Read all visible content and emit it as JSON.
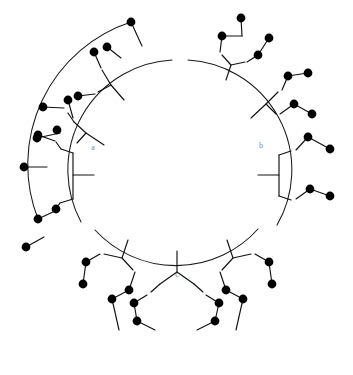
{
  "figure": {
    "type": "circular-dendrogram",
    "title": "",
    "background_color": "#ffffff",
    "line_color": "#111111",
    "tip_color": "#000000",
    "label_color": "#8a8a8a",
    "width": 353,
    "height": 375,
    "center": {
      "x": 176,
      "y": 175
    },
    "inner_radius": 72,
    "arc_radius": 96
  },
  "clusters": [
    {
      "id": "a",
      "label": "a",
      "label_position": {
        "x": 93,
        "y": 148
      },
      "arc": {
        "start_angle_deg": 153,
        "end_angle_deg": 293
      },
      "tip_count": 10,
      "description": "left cluster"
    },
    {
      "id": "b",
      "label": "b",
      "label_position": {
        "x": 261,
        "y": 146
      },
      "arc": {
        "start_angle_deg": 20,
        "end_angle_deg": 148
      },
      "tip_count": 11,
      "description": "right cluster"
    },
    {
      "id": "c",
      "label": "c",
      "label_position": {
        "x": 177,
        "y": 275
      },
      "arc": {
        "start_angle_deg": 300,
        "end_angle_deg": 14
      },
      "tip_count": 16,
      "description": "bottom cluster"
    }
  ],
  "chart_data": {
    "type": "tree",
    "title": "",
    "xlabel": "",
    "ylabel": "",
    "legend": [],
    "clusters": [
      "a",
      "b",
      "c"
    ],
    "tips_per_cluster": {
      "a": 10,
      "b": 11,
      "c": 16
    },
    "total_tips": 37
  },
  "geometry": {
    "arcs": [
      {
        "name": "arc-a-outer",
        "d": "M 131 22 A 150 150 0 0 0 38 219"
      },
      {
        "name": "arc-a-inner",
        "d": "M 172 60 A 110 110 0 0 0 81 222"
      },
      {
        "name": "arc-b-inner",
        "d": "M 188 60 A 110 110 0 0 1 277 225"
      },
      {
        "name": "arc-c-inner",
        "d": "M 95 230 A 110 110 0 0 0 258 229"
      }
    ],
    "branches": [
      {
        "name": "a-trunk",
        "d": "M 94 175 L 73 175"
      },
      {
        "name": "a-split",
        "d": "M 73 175 L 73 153 M 73 175 L 73 199"
      },
      {
        "name": "a-u1",
        "d": "M 73 153 L 61 149"
      },
      {
        "name": "a-u1b",
        "d": "M 61 149 L 56 142"
      },
      {
        "name": "a-l1",
        "d": "M 73 199 L 60 203"
      },
      {
        "name": "a-l1b",
        "d": "M 60 203 L 55 210"
      },
      {
        "name": "a-tip1-stem",
        "d": "M 55 141 L 38 135"
      },
      {
        "name": "a-tip2-stem",
        "d": "M 47 167 L 24 167"
      },
      {
        "name": "a-tip3-stem",
        "d": "M 55 211 L 38 219"
      },
      {
        "name": "a-tip4-stem",
        "d": "M 44 237 L 26 247"
      },
      {
        "name": "a-b2-trunk",
        "d": "M 104 145 L 86 133"
      },
      {
        "name": "a-b2-split",
        "d": "M 86 133 L 74 122 M 86 133 L 77 143"
      },
      {
        "name": "a-b2-u",
        "d": "M 74 122 L 68 113"
      },
      {
        "name": "a-b2-tipA",
        "d": "M 64 108 L 43 107"
      },
      {
        "name": "a-b2-tipB",
        "d": "M 60 133 L 37 138"
      },
      {
        "name": "a-b2-tipC",
        "d": "M 73 118 L 68 100"
      },
      {
        "name": "a-b3-trunk",
        "d": "M 124 100 L 111 85"
      },
      {
        "name": "a-b3-split",
        "d": "M 111 85 L 102 70 M 111 85 L 98 92"
      },
      {
        "name": "a-b3-tipD",
        "d": "M 95 94 L 78 96"
      },
      {
        "name": "a-b3-tipE",
        "d": "M 101 68 L 94 52"
      },
      {
        "name": "a-b3-tipF",
        "d": "M 121 58 L 107 47"
      },
      {
        "name": "a-b3-tipG",
        "d": "M 142 46 L 131 22"
      },
      {
        "name": "b-trunk",
        "d": "M 258 175 L 279 175"
      },
      {
        "name": "b-split",
        "d": "M 279 175 L 279 155 M 279 175 L 279 196"
      },
      {
        "name": "b-u1",
        "d": "M 279 155 L 291 151"
      },
      {
        "name": "b-l1",
        "d": "M 279 196 L 291 200"
      },
      {
        "name": "b-u-tipA",
        "d": "M 296 150 L 308 137"
      },
      {
        "name": "b-u-tipB",
        "d": "M 308 137 L 330 149"
      },
      {
        "name": "b-l-tipA",
        "d": "M 296 199 L 310 189"
      },
      {
        "name": "b-l-tipB",
        "d": "M 310 189 L 330 196"
      },
      {
        "name": "b-b2-trunk",
        "d": "M 251 118 L 266 104"
      },
      {
        "name": "b-b2-split",
        "d": "M 266 104 L 278 92 M 266 104 L 276 114"
      },
      {
        "name": "b-b2-tipA",
        "d": "M 280 114 L 294 104"
      },
      {
        "name": "b-b2-tipB",
        "d": "M 294 104 L 312 114"
      },
      {
        "name": "b-b2-tipC",
        "d": "M 282 90 L 288 76"
      },
      {
        "name": "b-b2-tipD",
        "d": "M 288 76 L 308 73"
      },
      {
        "name": "b-b3-trunk",
        "d": "M 226 80 L 231 65"
      },
      {
        "name": "b-b3-split",
        "d": "M 231 65 L 222 55 M 231 65 L 245 62"
      },
      {
        "name": "b-b3-tipA",
        "d": "M 247 62 L 258 55"
      },
      {
        "name": "b-b3-tipB",
        "d": "M 258 55 L 269 38"
      },
      {
        "name": "b-b3-tipC",
        "d": "M 220 52 L 222 36"
      },
      {
        "name": "b-b3-tipD",
        "d": "M 222 36 L 242 36"
      },
      {
        "name": "b-b3-tipE",
        "d": "M 242 36 L 241 18"
      },
      {
        "name": "c-trunk",
        "d": "M 177 251 L 177 272"
      },
      {
        "name": "c-split",
        "d": "M 177 272 L 160 284 M 177 272 L 194 284"
      },
      {
        "name": "c-l-u",
        "d": "M 160 284 L 151 292"
      },
      {
        "name": "c-r-u",
        "d": "M 194 284 L 203 292"
      },
      {
        "name": "c-l-tipA",
        "d": "M 147 295 L 134 303"
      },
      {
        "name": "c-l-tipB",
        "d": "M 134 303 L 137 321"
      },
      {
        "name": "c-l-tipC",
        "d": "M 137 321 L 155 330"
      },
      {
        "name": "c-r-tipA",
        "d": "M 206 295 L 219 303"
      },
      {
        "name": "c-r-tipB",
        "d": "M 219 303 L 215 321"
      },
      {
        "name": "c-r-tipC",
        "d": "M 215 321 L 197 330"
      },
      {
        "name": "c-bl-trunk",
        "d": "M 128 240 L 122 258"
      },
      {
        "name": "c-bl-split",
        "d": "M 122 258 L 104 254 M 122 258 L 133 270"
      },
      {
        "name": "c-bl-tipA",
        "d": "M 100 254 L 86 262"
      },
      {
        "name": "c-bl-tipB",
        "d": "M 86 262 L 83 284"
      },
      {
        "name": "c-bl-tipC",
        "d": "M 135 272 L 129 290"
      },
      {
        "name": "c-bl-tipD",
        "d": "M 129 290 L 112 299"
      },
      {
        "name": "c-bl-tipE",
        "d": "M 112 299 L 119 330"
      },
      {
        "name": "c-br-trunk",
        "d": "M 227 240 L 233 258"
      },
      {
        "name": "c-br-split",
        "d": "M 233 258 L 251 254 M 233 258 L 222 270"
      },
      {
        "name": "c-br-tipA",
        "d": "M 255 254 L 269 262"
      },
      {
        "name": "c-br-tipB",
        "d": "M 269 262 L 272 284"
      },
      {
        "name": "c-br-tipC",
        "d": "M 220 272 L 226 290"
      },
      {
        "name": "c-br-tipD",
        "d": "M 226 290 L 243 299"
      },
      {
        "name": "c-br-tipE",
        "d": "M 243 299 L 236 330"
      }
    ],
    "tips": [
      {
        "name": "tip-a-01",
        "cx": 38,
        "cy": 135,
        "r": 4.4
      },
      {
        "name": "tip-a-02",
        "cx": 24,
        "cy": 167,
        "r": 4.4
      },
      {
        "name": "tip-a-03",
        "cx": 38,
        "cy": 219,
        "r": 4.4
      },
      {
        "name": "tip-a-04",
        "cx": 26,
        "cy": 247,
        "r": 4.4
      },
      {
        "name": "tip-a-05",
        "cx": 43,
        "cy": 107,
        "r": 4.4
      },
      {
        "name": "tip-a-06",
        "cx": 37,
        "cy": 138,
        "r": 4.4
      },
      {
        "name": "tip-a-07",
        "cx": 68,
        "cy": 100,
        "r": 4.4
      },
      {
        "name": "tip-a-08",
        "cx": 78,
        "cy": 96,
        "r": 4.4
      },
      {
        "name": "tip-a-09",
        "cx": 94,
        "cy": 52,
        "r": 4.4
      },
      {
        "name": "tip-a-10",
        "cx": 107,
        "cy": 47,
        "r": 4.4
      },
      {
        "name": "tip-a-11",
        "cx": 131,
        "cy": 22,
        "r": 4.4
      },
      {
        "name": "tip-a-12",
        "cx": 57,
        "cy": 130,
        "r": 4.4
      },
      {
        "name": "tip-a-13",
        "cx": 56,
        "cy": 209,
        "r": 4.4
      },
      {
        "name": "tip-b-01",
        "cx": 330,
        "cy": 149,
        "r": 4.4
      },
      {
        "name": "tip-b-02",
        "cx": 308,
        "cy": 137,
        "r": 4.4
      },
      {
        "name": "tip-b-03",
        "cx": 330,
        "cy": 196,
        "r": 4.4
      },
      {
        "name": "tip-b-04",
        "cx": 310,
        "cy": 189,
        "r": 4.4
      },
      {
        "name": "tip-b-05",
        "cx": 312,
        "cy": 114,
        "r": 4.4
      },
      {
        "name": "tip-b-06",
        "cx": 294,
        "cy": 104,
        "r": 4.4
      },
      {
        "name": "tip-b-07",
        "cx": 308,
        "cy": 73,
        "r": 4.4
      },
      {
        "name": "tip-b-08",
        "cx": 288,
        "cy": 76,
        "r": 4.4
      },
      {
        "name": "tip-b-09",
        "cx": 269,
        "cy": 38,
        "r": 4.4
      },
      {
        "name": "tip-b-10",
        "cx": 258,
        "cy": 55,
        "r": 4.4
      },
      {
        "name": "tip-b-11",
        "cx": 241,
        "cy": 18,
        "r": 4.4
      },
      {
        "name": "tip-b-12",
        "cx": 222,
        "cy": 36,
        "r": 4.4
      },
      {
        "name": "tip-c-01",
        "cx": 86,
        "cy": 262,
        "r": 4.4
      },
      {
        "name": "tip-c-02",
        "cx": 83,
        "cy": 284,
        "r": 4.4
      },
      {
        "name": "tip-c-03",
        "cx": 129,
        "cy": 290,
        "r": 4.4
      },
      {
        "name": "tip-c-04",
        "cx": 112,
        "cy": 299,
        "r": 4.4
      },
      {
        "name": "tip-c-05",
        "cx": 134,
        "cy": 303,
        "r": 4.4
      },
      {
        "name": "tip-c-06",
        "cx": 137,
        "cy": 321,
        "r": 4.4
      },
      {
        "name": "tip-c-07",
        "cx": 219,
        "cy": 303,
        "r": 4.4
      },
      {
        "name": "tip-c-08",
        "cx": 215,
        "cy": 321,
        "r": 4.4
      },
      {
        "name": "tip-c-09",
        "cx": 226,
        "cy": 290,
        "r": 4.4
      },
      {
        "name": "tip-c-10",
        "cx": 243,
        "cy": 299,
        "r": 4.4
      },
      {
        "name": "tip-c-11",
        "cx": 269,
        "cy": 262,
        "r": 4.4
      },
      {
        "name": "tip-c-12",
        "cx": 272,
        "cy": 284,
        "r": 4.4
      }
    ]
  }
}
